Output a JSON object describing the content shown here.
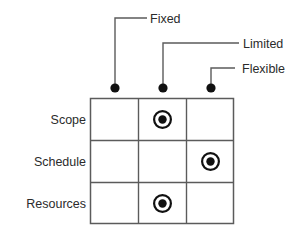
{
  "diagram": {
    "type": "constraint-matrix",
    "title": "",
    "column_headers": [
      {
        "label": "Fixed",
        "marker": "callout-dot"
      },
      {
        "label": "Limited",
        "marker": "callout-dot"
      },
      {
        "label": "Flexible",
        "marker": "callout-dot"
      }
    ],
    "row_headers": [
      {
        "label": "Scope"
      },
      {
        "label": "Schedule"
      },
      {
        "label": "Resources"
      }
    ],
    "cells": [
      [
        {
          "marked": false
        },
        {
          "marked": true
        },
        {
          "marked": false
        }
      ],
      [
        {
          "marked": false
        },
        {
          "marked": false
        },
        {
          "marked": true
        }
      ],
      [
        {
          "marked": false
        },
        {
          "marked": true
        },
        {
          "marked": false
        }
      ]
    ],
    "marker_icon": "target-dot-icon",
    "colors": {
      "line": "#5b5b5b",
      "text": "#2b2b2b",
      "marker": "#111111",
      "background": "#ffffff"
    }
  }
}
